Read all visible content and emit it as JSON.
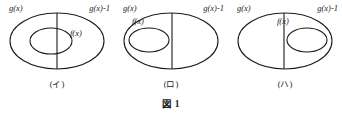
{
  "figure": {
    "caption": "図 1",
    "panels": [
      {
        "id": "panel-a",
        "caption": "(イ)",
        "outer_left_label": "g(x)",
        "outer_right_label": "g(x)-1",
        "inner_label": "f(x)",
        "inner_position": "center-straddling-divider"
      },
      {
        "id": "panel-b",
        "caption": "(ロ)",
        "outer_left_label": "g(x)",
        "outer_right_label": "g(x)-1",
        "inner_label": "f(x)",
        "inner_position": "left-of-divider"
      },
      {
        "id": "panel-c",
        "caption": "(ハ)",
        "outer_left_label": "g(x)",
        "outer_right_label": "g(x)-1",
        "inner_label": "f(x)",
        "inner_position": "right-of-divider"
      }
    ]
  },
  "style": {
    "stroke_color": "#1b1b1b",
    "background_color": "#ffffff",
    "text_color": "#1b1b1b"
  }
}
